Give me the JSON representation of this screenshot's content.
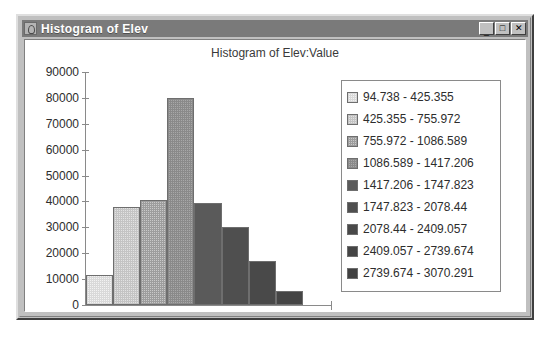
{
  "window": {
    "title": "Histogram of Elev",
    "icon": "histogram-window-icon",
    "buttons": {
      "minimize": "_",
      "maximize": "□",
      "close": "✕"
    }
  },
  "chart_data": {
    "type": "bar",
    "title": "Histogram of Elev:Value",
    "xlabel": "",
    "ylabel": "",
    "ylim": [
      0,
      90000
    ],
    "ytick_labels": [
      "90000",
      "80000",
      "70000",
      "60000",
      "50000",
      "40000",
      "30000",
      "20000",
      "10000",
      "0"
    ],
    "ytick_values": [
      90000,
      80000,
      70000,
      60000,
      50000,
      40000,
      30000,
      20000,
      10000,
      0
    ],
    "grid": false,
    "legend_position": "right",
    "categories": [
      "94.738 - 425.355",
      "425.355 - 755.972",
      "755.972 - 1086.589",
      "1086.589 - 1417.206",
      "1417.206 - 1747.823",
      "1747.823 - 2078.44",
      "2078.44 - 2409.057",
      "2409.057 - 2739.674",
      "2739.674 - 3070.291"
    ],
    "values": [
      11500,
      38000,
      40500,
      80000,
      39500,
      30000,
      17000,
      5500,
      0
    ],
    "bin_edges": [
      94.738,
      425.355,
      755.972,
      1086.589,
      1417.206,
      1747.823,
      2078.44,
      2409.057,
      2739.674,
      3070.291
    ],
    "colors": [
      "#f2f2f2",
      "#e2e2e2",
      "#c9c9c9",
      "#a8a8a8",
      "#5a5a5a",
      "#4f4f4f",
      "#494949",
      "#454545",
      "#414141"
    ]
  },
  "legend": {
    "items": [
      {
        "label": "94.738 - 425.355",
        "color": "#f2f2f2"
      },
      {
        "label": "425.355 - 755.972",
        "color": "#e2e2e2"
      },
      {
        "label": "755.972 - 1086.589",
        "color": "#c9c9c9"
      },
      {
        "label": "1086.589 - 1417.206",
        "color": "#a8a8a8"
      },
      {
        "label": "1417.206 - 1747.823",
        "color": "#5a5a5a"
      },
      {
        "label": "1747.823 - 2078.44",
        "color": "#4f4f4f"
      },
      {
        "label": "2078.44 - 2409.057",
        "color": "#494949"
      },
      {
        "label": "2409.057 - 2739.674",
        "color": "#454545"
      },
      {
        "label": "2739.674 - 3070.291",
        "color": "#414141"
      }
    ]
  }
}
